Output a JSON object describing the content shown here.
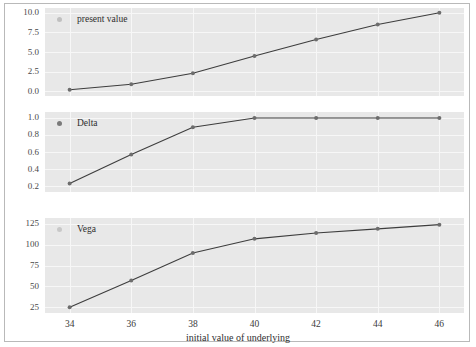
{
  "figure": {
    "xlabel": "initial value of underlying",
    "background": "#e8e8e8",
    "line_color": "#3d3d3d",
    "grid_color": "#f7f7f7"
  },
  "chart_data": [
    {
      "type": "line",
      "title": "",
      "legend_label": "present value",
      "legend_marker_color": "#c0c0c0",
      "xlabel": "",
      "ylabel": "",
      "x": [
        34,
        36,
        38,
        40,
        42,
        44,
        46
      ],
      "values": [
        0.2,
        0.9,
        2.3,
        4.5,
        6.6,
        8.5,
        10.0
      ],
      "yticks": [
        "0.0",
        "2.5",
        "5.0",
        "7.5",
        "10.0"
      ],
      "ytick_values": [
        0.0,
        2.5,
        5.0,
        7.5,
        10.0
      ],
      "ylim": [
        -0.6,
        10.6
      ],
      "xlim": [
        33.2,
        46.8
      ],
      "grid": true,
      "legend_position": "top-left"
    },
    {
      "type": "line",
      "title": "",
      "legend_label": "Delta",
      "legend_marker_color": "#7a7a7a",
      "xlabel": "",
      "ylabel": "",
      "x": [
        34,
        36,
        38,
        40,
        42,
        44,
        46
      ],
      "values": [
        0.23,
        0.57,
        0.89,
        1.0,
        1.0,
        1.0,
        1.0
      ],
      "yticks": [
        "0.2",
        "0.4",
        "0.6",
        "0.8",
        "1.0"
      ],
      "ytick_values": [
        0.2,
        0.4,
        0.6,
        0.8,
        1.0
      ],
      "ylim": [
        0.13,
        1.07
      ],
      "xlim": [
        33.2,
        46.8
      ],
      "grid": true,
      "legend_position": "top-left"
    },
    {
      "type": "line",
      "title": "",
      "legend_label": "Vega",
      "legend_marker_color": "#c8c8c8",
      "xlabel": "initial value of underlying",
      "ylabel": "",
      "x": [
        34,
        36,
        38,
        40,
        42,
        44,
        46
      ],
      "values": [
        25,
        57,
        90,
        107,
        114,
        119,
        124
      ],
      "yticks": [
        "25",
        "50",
        "75",
        "100",
        "125"
      ],
      "ytick_values": [
        25,
        50,
        75,
        100,
        125
      ],
      "ylim": [
        18,
        132
      ],
      "xlim": [
        33.2,
        46.8
      ],
      "grid": true,
      "legend_position": "top-left"
    }
  ],
  "xticks": [
    "34",
    "36",
    "38",
    "40",
    "42",
    "44",
    "46"
  ],
  "xtick_values": [
    34,
    36,
    38,
    40,
    42,
    44,
    46
  ]
}
